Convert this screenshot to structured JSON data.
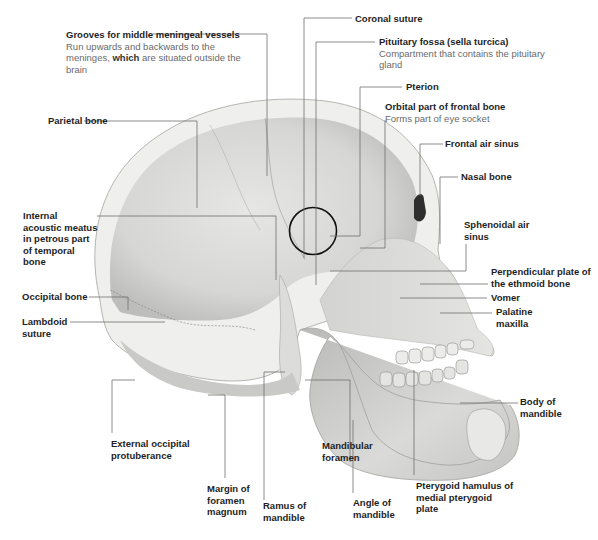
{
  "diagram": {
    "colors": {
      "background": "#ffffff",
      "bone_light": "#e9e9e7",
      "bone_mid": "#cfcfcd",
      "bone_dark": "#a9a9a7",
      "leader_line": "#6e6e6e",
      "label_title": "#1e1e1e",
      "label_description": "#6a6a6a",
      "highlight_circle": "#111111"
    },
    "labels": [
      {
        "id": "grooves",
        "title": "Grooves for middle meningeal vessels",
        "description_pre": "Run upwards and backwards to the meninges, ",
        "description_bold": "which",
        "description_post": " are situated outside the brain"
      },
      {
        "id": "coronal",
        "title": "Coronal suture"
      },
      {
        "id": "pituitary",
        "title": "Pituitary fossa (sella turcica)",
        "description": "Compartment that contains the pituitary gland"
      },
      {
        "id": "pterion",
        "title": "Pterion"
      },
      {
        "id": "orbital",
        "title": "Orbital part of frontal bone",
        "description": "Forms part of eye socket"
      },
      {
        "id": "parietal",
        "title": "Parietal bone"
      },
      {
        "id": "frontal_sinus",
        "title": "Frontal air sinus"
      },
      {
        "id": "nasal",
        "title": "Nasal bone"
      },
      {
        "id": "internal_acoustic",
        "title": "Internal acoustic meatus in petrous part of temporal bone"
      },
      {
        "id": "sphenoidal",
        "title": "Sphenoidal air sinus"
      },
      {
        "id": "perpendicular",
        "title": "Perpendicular plate of the ethmoid bone"
      },
      {
        "id": "occipital",
        "title": "Occipital bone"
      },
      {
        "id": "vomer",
        "title": "Vomer"
      },
      {
        "id": "lambdoid",
        "title": "Lambdoid suture"
      },
      {
        "id": "palatine",
        "title": "Palatine maxilla"
      },
      {
        "id": "body_mandible",
        "title": "Body of mandible"
      },
      {
        "id": "ext_occipital",
        "title": "External occipital protuberance"
      },
      {
        "id": "mandibular_foramen",
        "title": "Mandibular foramen"
      },
      {
        "id": "pterygoid",
        "title": "Pterygoid hamulus of medial pterygoid plate"
      },
      {
        "id": "foramen_magnum",
        "title": "Margin of foramen magnum"
      },
      {
        "id": "ramus",
        "title": "Ramus of mandible"
      },
      {
        "id": "angle",
        "title": "Angle of mandible"
      }
    ]
  }
}
